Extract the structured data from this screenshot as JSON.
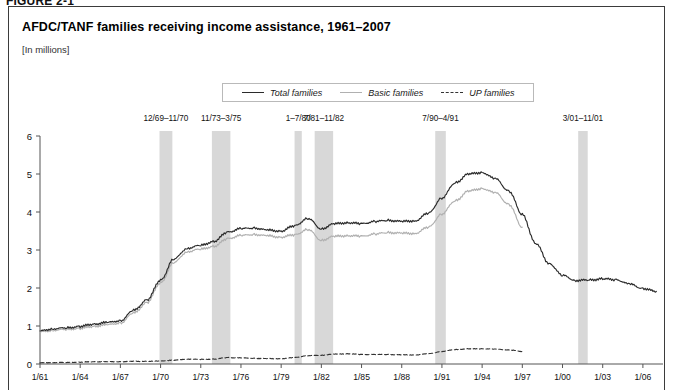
{
  "figure": {
    "label": "FIGURE 2-1"
  },
  "chart_data": {
    "type": "line",
    "title": "AFDC/TANF families receiving income assistance, 1961–2007",
    "subtitle": "[In millions]",
    "ylabel": "",
    "xlabel": "",
    "ylim": [
      0,
      6
    ],
    "xlim": [
      1961,
      2007.5
    ],
    "grid": false,
    "legend_position": "top-center",
    "yticks": [
      "0",
      "1",
      "2",
      "3",
      "4",
      "5",
      "6"
    ],
    "ytick_values": [
      0,
      1,
      2,
      3,
      4,
      5,
      6
    ],
    "xticks": [
      "1/61",
      "1/64",
      "1/67",
      "1/70",
      "1/73",
      "1/76",
      "1/79",
      "1/82",
      "1/85",
      "1/88",
      "1/91",
      "1/94",
      "1/97",
      "1/00",
      "1/03",
      "1/06"
    ],
    "xtick_values": [
      1961,
      1964,
      1967,
      1970,
      1973,
      1976,
      1979,
      1982,
      1985,
      1988,
      1991,
      1994,
      1997,
      2000,
      2003,
      2006
    ],
    "series": [
      {
        "name": "Total families",
        "style": "solid",
        "color": "#2b2b2b",
        "x": [
          1961,
          1962,
          1963,
          1964,
          1965,
          1966,
          1967,
          1968,
          1969,
          1970,
          1971,
          1972,
          1973,
          1974,
          1975,
          1976,
          1977,
          1978,
          1979,
          1980,
          1981,
          1982,
          1983,
          1984,
          1985,
          1986,
          1987,
          1988,
          1989,
          1990,
          1991,
          1992,
          1993,
          1994,
          1995,
          1996,
          1997,
          1998,
          1999,
          2000,
          2001,
          2002,
          2003,
          2004,
          2005,
          2006,
          2007
        ],
        "values": [
          0.87,
          0.93,
          0.95,
          0.99,
          1.05,
          1.09,
          1.14,
          1.41,
          1.69,
          2.21,
          2.76,
          3.05,
          3.12,
          3.23,
          3.47,
          3.56,
          3.58,
          3.52,
          3.5,
          3.64,
          3.83,
          3.56,
          3.69,
          3.72,
          3.69,
          3.75,
          3.78,
          3.75,
          3.77,
          3.97,
          4.37,
          4.77,
          5.0,
          5.04,
          4.87,
          4.55,
          3.93,
          3.17,
          2.65,
          2.33,
          2.2,
          2.21,
          2.24,
          2.22,
          2.1,
          1.99,
          1.91
        ]
      },
      {
        "name": "Basic families",
        "style": "solid",
        "color": "#b0b0b0",
        "x": [
          1961,
          1962,
          1963,
          1964,
          1965,
          1966,
          1967,
          1968,
          1969,
          1970,
          1971,
          1972,
          1973,
          1974,
          1975,
          1976,
          1977,
          1978,
          1979,
          1980,
          1981,
          1982,
          1983,
          1984,
          1985,
          1986,
          1987,
          1988,
          1989,
          1990,
          1991,
          1992,
          1993,
          1994,
          1995,
          1996,
          1997
        ],
        "values": [
          0.84,
          0.89,
          0.91,
          0.94,
          0.99,
          1.03,
          1.08,
          1.34,
          1.62,
          2.14,
          2.67,
          2.96,
          3.02,
          3.1,
          3.3,
          3.38,
          3.41,
          3.37,
          3.34,
          3.4,
          3.54,
          3.26,
          3.36,
          3.38,
          3.36,
          3.42,
          3.46,
          3.44,
          3.44,
          3.6,
          3.95,
          4.3,
          4.55,
          4.62,
          4.5,
          4.2,
          3.6
        ]
      },
      {
        "name": "UP families",
        "style": "dashed",
        "color": "#333333",
        "x": [
          1961,
          1962,
          1963,
          1964,
          1965,
          1966,
          1967,
          1968,
          1969,
          1970,
          1971,
          1972,
          1973,
          1974,
          1975,
          1976,
          1977,
          1978,
          1979,
          1980,
          1981,
          1982,
          1983,
          1984,
          1985,
          1986,
          1987,
          1988,
          1989,
          1990,
          1991,
          1992,
          1993,
          1994,
          1995,
          1996,
          1997
        ],
        "values": [
          0.03,
          0.04,
          0.04,
          0.05,
          0.06,
          0.06,
          0.06,
          0.07,
          0.07,
          0.08,
          0.1,
          0.13,
          0.12,
          0.13,
          0.17,
          0.16,
          0.15,
          0.14,
          0.14,
          0.17,
          0.22,
          0.23,
          0.26,
          0.27,
          0.25,
          0.25,
          0.25,
          0.24,
          0.24,
          0.27,
          0.33,
          0.38,
          0.4,
          0.4,
          0.39,
          0.37,
          0.33
        ]
      }
    ],
    "recession_bands": [
      {
        "label": "12/69–11/70",
        "start": 1969.92,
        "end": 1970.88
      },
      {
        "label": "11/73–3/75",
        "start": 1973.83,
        "end": 1975.21
      },
      {
        "label": "1–7/80",
        "start": 1980.0,
        "end": 1980.54
      },
      {
        "label": "7/81–11/82",
        "start": 1981.5,
        "end": 1982.88
      },
      {
        "label": "7/90–4/91",
        "start": 1990.5,
        "end": 1991.29
      },
      {
        "label": "3/01–11/01",
        "start": 2001.17,
        "end": 2001.88
      }
    ],
    "band_color": "#d8d8d8"
  }
}
